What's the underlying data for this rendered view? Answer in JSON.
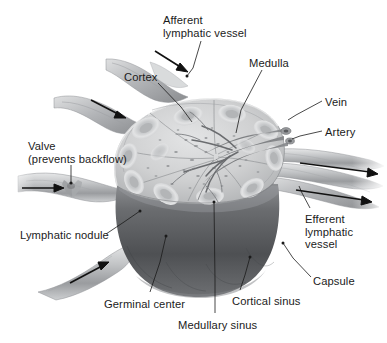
{
  "figure": {
    "background_color": "#ffffff",
    "text_color": "#1b1b1b",
    "width": 387,
    "height": 343
  },
  "labels": [
    {
      "key": "afferent_lymphatic_vessel",
      "lines": [
        "Afferent",
        "lymphatic vessel"
      ],
      "x": 163,
      "y": 14,
      "align": "left"
    },
    {
      "key": "cortex",
      "lines": [
        "Cortex"
      ],
      "x": 124,
      "y": 71,
      "align": "left"
    },
    {
      "key": "medulla",
      "lines": [
        "Medulla"
      ],
      "x": 249,
      "y": 57,
      "align": "left"
    },
    {
      "key": "vein",
      "lines": [
        "Vein"
      ],
      "x": 325,
      "y": 96,
      "align": "left"
    },
    {
      "key": "artery",
      "lines": [
        "Artery"
      ],
      "x": 325,
      "y": 126,
      "align": "left"
    },
    {
      "key": "valve",
      "lines": [
        "Valve",
        "(prevents backflow)"
      ],
      "x": 28,
      "y": 140,
      "align": "left"
    },
    {
      "key": "lymphatic_nodule",
      "lines": [
        "Lymphatic nodule"
      ],
      "x": 20,
      "y": 229,
      "align": "left"
    },
    {
      "key": "efferent_lymphatic_vessel",
      "lines": [
        "Efferent",
        "lymphatic",
        "vessel"
      ],
      "x": 305,
      "y": 213,
      "align": "left"
    },
    {
      "key": "capsule",
      "lines": [
        "Capsule"
      ],
      "x": 313,
      "y": 275,
      "align": "left"
    },
    {
      "key": "germinal_center",
      "lines": [
        "Germinal center"
      ],
      "x": 104,
      "y": 298,
      "align": "left"
    },
    {
      "key": "medullary_sinus",
      "lines": [
        "Medullary sinus"
      ],
      "x": 178,
      "y": 319,
      "align": "left"
    },
    {
      "key": "cortical_sinus",
      "lines": [
        "Cortical sinus"
      ],
      "x": 232,
      "y": 295,
      "align": "left"
    }
  ],
  "leader_lines": [
    {
      "key": "leader-afferent-vessel",
      "points": "201,41 193,68 187,76"
    },
    {
      "key": "leader-cortex",
      "points": "158,83 181,107 192,122"
    },
    {
      "key": "leader-medulla",
      "points": "262,70 241,110 236,133"
    },
    {
      "key": "leader-vein",
      "points": "322,101 296,115 288,120"
    },
    {
      "key": "leader-artery",
      "points": "322,131 300,136 292,139"
    },
    {
      "key": "leader-valve",
      "points": "71,165 71,180 71,184"
    },
    {
      "key": "leader-lymphatic-nodule",
      "points": "106,234 124,222 140,211"
    },
    {
      "key": "leader-efferent-vessel",
      "points": "310,208 304,195 300,187"
    },
    {
      "key": "leader-capsule",
      "points": "311,277 293,258 283,243"
    },
    {
      "key": "leader-germinal-center",
      "points": "150,292 160,262 166,236"
    },
    {
      "key": "leader-medullary-sinus",
      "points": "215,313 215,280 214,202"
    },
    {
      "key": "leader-cortical-sinus",
      "points": "240,290 245,275 250,257"
    }
  ],
  "flow_arrows": [
    {
      "key": "arrow-afferent-top",
      "direction": "into-node",
      "from": [
        155,
        51
      ],
      "to": [
        186,
        71
      ]
    },
    {
      "key": "arrow-afferent-upper-left",
      "direction": "into-node",
      "from": [
        91,
        100
      ],
      "to": [
        125,
        118
      ]
    },
    {
      "key": "arrow-afferent-left",
      "direction": "into-node",
      "from": [
        22,
        188
      ],
      "to": [
        62,
        188
      ]
    },
    {
      "key": "arrow-afferent-lower-left",
      "direction": "into-node",
      "from": [
        70,
        283
      ],
      "to": [
        108,
        263
      ]
    },
    {
      "key": "arrow-efferent-upper",
      "direction": "out-of-node",
      "from": [
        300,
        163
      ],
      "to": [
        378,
        174
      ]
    },
    {
      "key": "arrow-efferent-lower",
      "direction": "out-of-node",
      "from": [
        296,
        190
      ],
      "to": [
        372,
        202
      ]
    }
  ],
  "anatomy": {
    "cut_surface_color": "#c9cacb",
    "capsule_body_color": "#5e6063",
    "vessel_color": "#b6b8ba",
    "nodule_ring_color": "#d8d9da",
    "germinal_center_color": "#b0b2b4",
    "nodule_count": 12,
    "lobe_count": 6
  }
}
